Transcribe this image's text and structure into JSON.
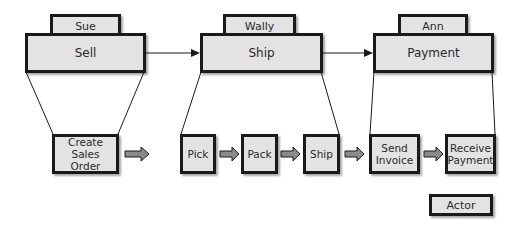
{
  "colors": {
    "box_fill": "#e3e3e3",
    "box_border": "#1a1a1a",
    "arrow_fill": "#8a8a8a",
    "line": "#1a1a1a"
  },
  "phases": [
    {
      "label": "Sell",
      "actor": "Sue"
    },
    {
      "label": "Ship",
      "actor": "Wally"
    },
    {
      "label": "Payment",
      "actor": "Ann"
    }
  ],
  "steps": [
    {
      "label": "Create Sales Order",
      "phase": "Sell"
    },
    {
      "label": "Pick",
      "phase": "Ship"
    },
    {
      "label": "Pack",
      "phase": "Ship"
    },
    {
      "label": "Ship",
      "phase": "Ship"
    },
    {
      "label": "Send Invoice",
      "phase": "Payment"
    },
    {
      "label": "Receive Payment",
      "phase": "Payment"
    }
  ],
  "legend": {
    "label": "Actor"
  }
}
